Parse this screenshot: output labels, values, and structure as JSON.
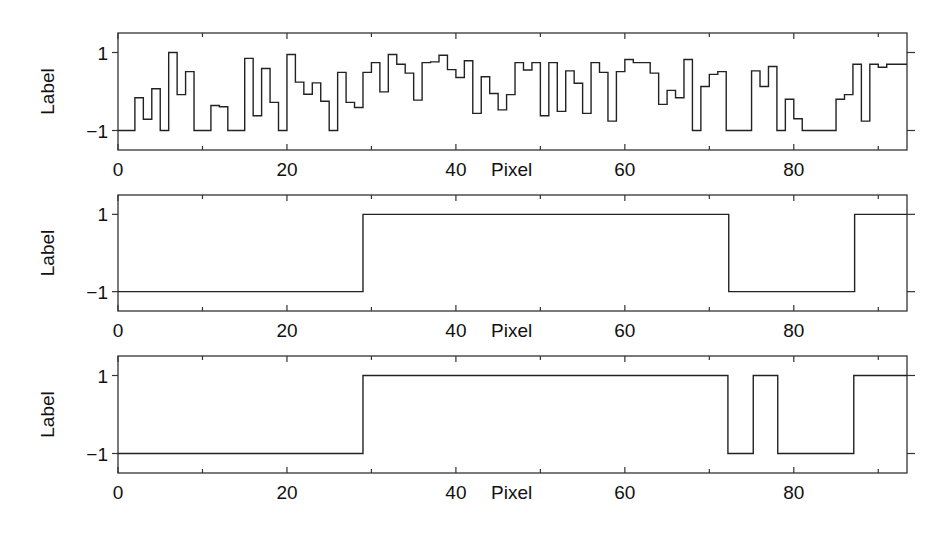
{
  "chart_data": [
    {
      "type": "line",
      "step": true,
      "title": "",
      "xlabel": "Pixel",
      "ylabel": "Label",
      "xlim": [
        0,
        93.4
      ],
      "ylim": [
        -1.5,
        1.5
      ],
      "xticks_major": [
        0,
        20,
        40,
        60,
        80
      ],
      "xticks_minor": [
        10,
        30,
        50,
        70,
        90
      ],
      "xtick_labels": [
        "0",
        "20",
        "40",
        "60",
        "80"
      ],
      "yticks": [
        1,
        -1
      ],
      "ytick_labels": [
        "1",
        "−1"
      ],
      "grid": false,
      "legend": null,
      "series": [
        {
          "name": "noisy labels",
          "x": [
            0,
            1,
            2,
            3,
            4,
            5,
            6,
            7,
            8,
            9,
            10,
            11,
            12,
            13,
            14,
            15,
            16,
            17,
            18,
            19,
            20,
            21,
            22,
            23,
            24,
            25,
            26,
            27,
            28,
            29,
            30,
            31,
            32,
            33,
            34,
            35,
            36,
            37,
            38,
            39,
            40,
            41,
            42,
            43,
            44,
            45,
            46,
            47,
            48,
            49,
            50,
            51,
            52,
            53,
            54,
            55,
            56,
            57,
            58,
            59,
            60,
            61,
            62,
            63,
            64,
            65,
            66,
            67,
            68,
            69,
            70,
            71,
            72,
            73,
            74,
            75,
            76,
            77,
            78,
            79,
            80,
            81,
            82,
            83,
            84,
            85,
            86,
            87,
            88,
            89,
            90,
            91,
            92
          ],
          "values": [
            -1,
            -1,
            -0.16,
            -0.71,
            0.07,
            -1,
            1.0,
            -0.08,
            0.51,
            -1,
            -1,
            -0.36,
            -0.39,
            -1,
            -1,
            0.85,
            -0.62,
            0.59,
            -0.28,
            -1,
            0.95,
            0.24,
            -0.07,
            0.22,
            -0.25,
            -1,
            0.49,
            -0.28,
            -0.41,
            0.49,
            0.74,
            -0.01,
            0.95,
            0.7,
            0.47,
            -0.22,
            0.74,
            0.76,
            0.93,
            0.56,
            0.36,
            0.79,
            -0.56,
            0.38,
            -0.05,
            -0.47,
            -0.08,
            0.74,
            0.55,
            0.74,
            -0.62,
            0.74,
            -0.51,
            0.53,
            0.21,
            -0.56,
            0.74,
            0.49,
            -0.76,
            0.51,
            0.82,
            0.74,
            0.74,
            0.47,
            -0.33,
            0.03,
            -0.16,
            0.82,
            -1,
            0.13,
            0.44,
            0.51,
            -1,
            -1,
            -1,
            0.53,
            0.13,
            0.64,
            -1,
            -0.2,
            -0.7,
            -1,
            -1,
            -1,
            -1,
            -0.2,
            -0.08,
            0.7,
            -0.76,
            0.7,
            0.62,
            0.7,
            0.7
          ]
        }
      ]
    },
    {
      "type": "line",
      "step": true,
      "title": "",
      "xlabel": "Pixel",
      "ylabel": "Label",
      "xlim": [
        0,
        93.4
      ],
      "ylim": [
        -1.5,
        1.5
      ],
      "xticks_major": [
        0,
        20,
        40,
        60,
        80
      ],
      "xticks_minor": [
        10,
        30,
        50,
        70,
        90
      ],
      "xtick_labels": [
        "0",
        "20",
        "40",
        "60",
        "80"
      ],
      "yticks": [
        1,
        -1
      ],
      "ytick_labels": [
        "1",
        "−1"
      ],
      "grid": false,
      "legend": null,
      "series": [
        {
          "name": "ground truth labels",
          "x": [
            0,
            29,
            72.3,
            87.2
          ],
          "values": [
            -1,
            1,
            -1,
            1
          ]
        }
      ]
    },
    {
      "type": "line",
      "step": true,
      "title": "",
      "xlabel": "Pixel",
      "ylabel": "Label",
      "xlim": [
        0,
        93.4
      ],
      "ylim": [
        -1.5,
        1.5
      ],
      "xticks_major": [
        0,
        20,
        40,
        60,
        80
      ],
      "xticks_minor": [
        10,
        30,
        50,
        70,
        90
      ],
      "xtick_labels": [
        "0",
        "20",
        "40",
        "60",
        "80"
      ],
      "yticks": [
        1,
        -1
      ],
      "ytick_labels": [
        "1",
        "−1"
      ],
      "grid": false,
      "legend": null,
      "series": [
        {
          "name": "estimated labels",
          "x": [
            0,
            29,
            72.2,
            75.2,
            78.1,
            87.1
          ],
          "values": [
            -1,
            1,
            -1,
            1,
            -1,
            1
          ]
        }
      ]
    }
  ],
  "panels": [
    {
      "id": "top",
      "box": {
        "left": 118,
        "top": 33,
        "right": 907,
        "bottom": 150
      }
    },
    {
      "id": "middle",
      "box": {
        "left": 118,
        "top": 195,
        "right": 907,
        "bottom": 311
      }
    },
    {
      "id": "bottom",
      "box": {
        "left": 118,
        "top": 356,
        "right": 907,
        "bottom": 473
      }
    }
  ]
}
